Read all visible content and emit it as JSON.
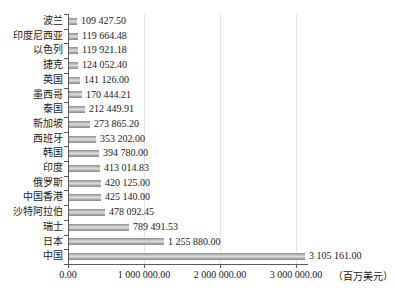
{
  "chart_data": {
    "type": "bar",
    "orientation": "horizontal",
    "title": "",
    "categories": [
      "波兰",
      "印度尼西亚",
      "以色列",
      "捷克",
      "英国",
      "墨西哥",
      "泰国",
      "新加坡",
      "西班牙",
      "韩国",
      "印度",
      "俄罗斯",
      "中国香港",
      "沙特阿拉伯",
      "瑞士",
      "日本",
      "中国"
    ],
    "values": [
      109427.5,
      119664.48,
      119921.18,
      124052.4,
      141126.0,
      170444.21,
      212449.91,
      273865.2,
      353202.0,
      394780.0,
      413014.83,
      420125.0,
      425140.0,
      478092.45,
      789491.53,
      1255880.0,
      3105161.0
    ],
    "value_labels": [
      "109 427.50",
      "119 664.48",
      "119 921.18",
      "124 052.40",
      "141 126.00",
      "170 444.21",
      "212 449.91",
      "273 865.20",
      "353 202.00",
      "394 780.00",
      "413 014.83",
      "420 125.00",
      "425 140.00",
      "478 092.45",
      "789 491.53",
      "1 255 880.00",
      "3 105 161.00"
    ],
    "x_ticks": [
      {
        "value": 0,
        "label": "0.00"
      },
      {
        "value": 1000000,
        "label": "1 000 000.00"
      },
      {
        "value": 2000000,
        "label": "2 000 000.00"
      },
      {
        "value": 3000000,
        "label": "3 000 000.00"
      }
    ],
    "unit_label": "（百万美元）",
    "xlim": [
      0,
      3105161
    ],
    "grid": true,
    "legend": false,
    "colors": {
      "bar_gradient": [
        "#8c8c8c",
        "#c8c8c8",
        "#dedede",
        "#a2a2a2",
        "#8c8c8c"
      ],
      "axis": "#595959",
      "gridline": "#e3e3e3",
      "text": "#1a1a1a",
      "background": "#ffffff"
    }
  }
}
